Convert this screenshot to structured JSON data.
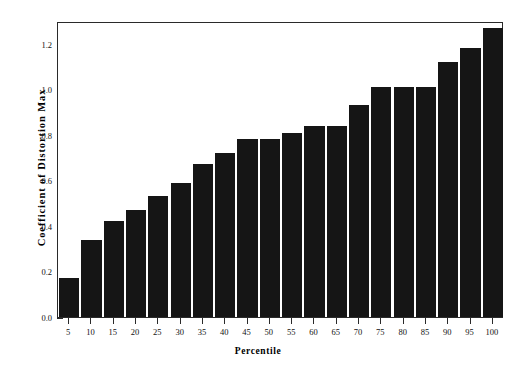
{
  "chart_data": {
    "type": "bar",
    "title": "",
    "xlabel": "Percentile",
    "ylabel": "Coefficient of Distortion Max",
    "categories": [
      "5",
      "10",
      "15",
      "20",
      "25",
      "30",
      "35",
      "40",
      "45",
      "50",
      "55",
      "60",
      "65",
      "70",
      "75",
      "80",
      "85",
      "90",
      "95",
      "100"
    ],
    "values": [
      0.17,
      0.34,
      0.42,
      0.47,
      0.53,
      0.59,
      0.67,
      0.72,
      0.78,
      0.78,
      0.81,
      0.84,
      0.84,
      0.93,
      1.01,
      1.01,
      1.01,
      1.12,
      1.18,
      1.27
    ],
    "ylim": [
      0.0,
      1.3
    ],
    "xlim": [
      0,
      20
    ],
    "ytick_labels": [
      "0.0",
      "0.2",
      "0.4",
      "0.6",
      "0.8",
      "1.0",
      "1.2"
    ],
    "ytick_values": [
      0.0,
      0.2,
      0.4,
      0.6,
      0.8,
      1.0,
      1.2
    ],
    "yminor_step": 0.05,
    "grid": false,
    "legend": null,
    "bar_color": "#151515",
    "axis_color": "#2a2a2a",
    "background": "#ffffff"
  },
  "axes": {
    "y_title": "Coefficient of Distortion Max",
    "x_title": "Percentile"
  }
}
